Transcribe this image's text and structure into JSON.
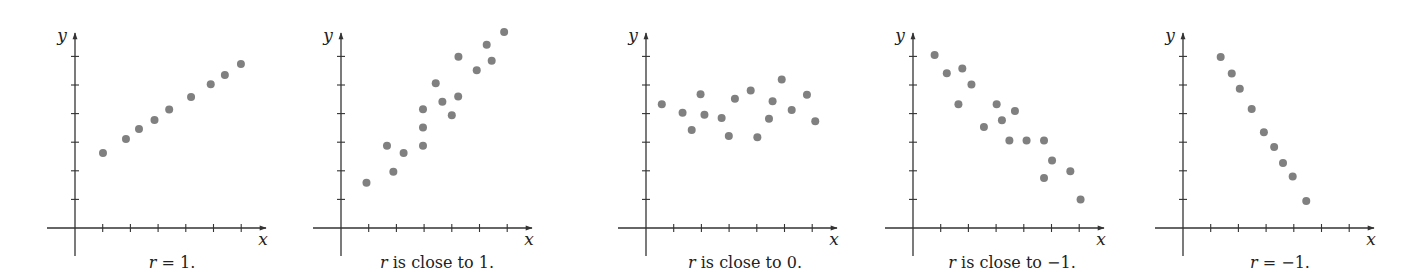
{
  "figure": {
    "layout": {
      "x_unit_px": 27.7,
      "y_unit_px": 28.6,
      "x_axis_y_px": 228,
      "y_axis_top_px": 33,
      "y_axis_bottom_px": 256,
      "x_axis_left_offset": -28,
      "x_axis_right_offset": 191,
      "x_ticks": [
        1,
        2,
        3,
        4,
        5,
        6
      ],
      "y_ticks": [
        1,
        2,
        3,
        4,
        5,
        6
      ],
      "point_radius": 4,
      "point_color": "#808080",
      "axis_color": "#333333"
    }
  },
  "chart_data": [
    {
      "type": "scatter",
      "title": "",
      "xlabel": "x",
      "ylabel": "y",
      "caption": "r = 1.",
      "caption_italic_prefix": "r",
      "caption_rest": " = 1.",
      "origin_x_px": 75,
      "caption_center_px": 172,
      "xlim": [
        -1,
        7
      ],
      "ylim": [
        -1,
        7
      ],
      "grid": false,
      "x": [
        1.01,
        1.84,
        2.31,
        2.87,
        3.4,
        4.19,
        4.9,
        5.41,
        5.99
      ],
      "y": [
        2.62,
        3.11,
        3.46,
        3.78,
        4.14,
        4.58,
        5.03,
        5.35,
        5.73
      ]
    },
    {
      "type": "scatter",
      "title": "",
      "xlabel": "x",
      "ylabel": "y",
      "caption": "r is close to 1.",
      "caption_italic_prefix": "r",
      "caption_rest": " is close to 1.",
      "origin_x_px": 341,
      "caption_center_px": 437,
      "xlim": [
        -1,
        7
      ],
      "ylim": [
        -1,
        7
      ],
      "grid": false,
      "x": [
        0.92,
        1.66,
        1.89,
        2.26,
        2.96,
        2.96,
        2.96,
        3.42,
        3.66,
        4.0,
        4.23,
        4.24,
        4.9,
        5.26,
        5.44,
        5.89
      ],
      "y": [
        1.58,
        2.88,
        1.97,
        2.62,
        2.88,
        3.51,
        4.15,
        5.06,
        4.41,
        3.94,
        4.6,
        5.99,
        5.52,
        6.41,
        5.85,
        6.85
      ]
    },
    {
      "type": "scatter",
      "title": "",
      "xlabel": "x",
      "ylabel": "y",
      "caption": "r is close to 0.",
      "caption_italic_prefix": "r",
      "caption_rest": " is close to 0.",
      "origin_x_px": 646,
      "caption_center_px": 745,
      "xlim": [
        -1,
        7
      ],
      "ylim": [
        -1,
        7
      ],
      "grid": false,
      "x": [
        0.57,
        1.32,
        1.65,
        1.97,
        2.11,
        2.73,
        2.99,
        3.21,
        3.78,
        4.02,
        4.44,
        4.57,
        4.9,
        5.26,
        5.81,
        6.11
      ],
      "y": [
        4.33,
        4.03,
        3.43,
        4.68,
        3.96,
        3.85,
        3.22,
        4.52,
        4.81,
        3.17,
        3.82,
        4.43,
        5.19,
        4.13,
        4.66,
        3.73
      ]
    },
    {
      "type": "scatter",
      "title": "",
      "xlabel": "x",
      "ylabel": "y",
      "caption": "r is close to −1.",
      "caption_italic_prefix": "r",
      "caption_rest": " is close to −1.",
      "origin_x_px": 913,
      "caption_center_px": 1012,
      "xlim": [
        -1,
        7
      ],
      "ylim": [
        -1,
        7
      ],
      "grid": false,
      "x": [
        0.78,
        1.22,
        1.78,
        1.64,
        2.11,
        2.56,
        3.02,
        3.21,
        3.68,
        3.48,
        4.1,
        4.73,
        5.02,
        4.73,
        5.68,
        6.05
      ],
      "y": [
        6.05,
        5.41,
        5.58,
        4.33,
        5.02,
        3.53,
        4.33,
        3.77,
        4.09,
        3.06,
        3.06,
        3.06,
        2.36,
        1.75,
        1.98,
        1.0
      ]
    },
    {
      "type": "scatter",
      "title": "",
      "xlabel": "x",
      "ylabel": "y",
      "caption": "r = −1.",
      "caption_italic_prefix": "r",
      "caption_rest": " = −1.",
      "origin_x_px": 1183,
      "caption_center_px": 1280,
      "xlim": [
        -1,
        7
      ],
      "ylim": [
        -1,
        7
      ],
      "grid": false,
      "x": [
        1.36,
        1.76,
        2.05,
        2.48,
        2.92,
        3.29,
        3.61,
        3.96,
        4.45
      ],
      "y": [
        5.98,
        5.4,
        4.87,
        4.16,
        3.35,
        2.83,
        2.27,
        1.8,
        0.94
      ]
    }
  ]
}
